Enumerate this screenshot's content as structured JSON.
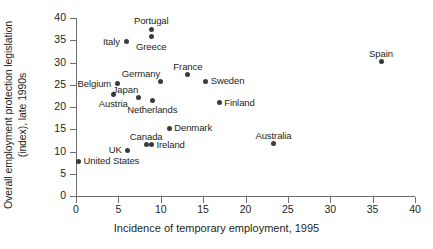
{
  "chart_data": {
    "type": "scatter",
    "title": "",
    "xlabel": "Incidence of temporary employment, 1995",
    "ylabel_line1": "Overall employment protection legislation",
    "ylabel_line2": "(index), late 1990s",
    "xlim": [
      0,
      40
    ],
    "ylim": [
      0,
      40
    ],
    "xticks": [
      "0",
      "5",
      "10",
      "15",
      "20",
      "25",
      "30",
      "35",
      "40"
    ],
    "yticks": [
      "0",
      "5",
      "10",
      "15",
      "20",
      "25",
      "30",
      "35",
      "40"
    ],
    "grid": false,
    "legend": "none",
    "marker_color": "#3b3b3d",
    "axis_color": "#6d6e71",
    "points": [
      {
        "name": "Portugal",
        "x": 8.9,
        "y": 37.5,
        "label_pos": "above"
      },
      {
        "name": "Greece",
        "x": 8.9,
        "y": 35.8,
        "label_pos": "below"
      },
      {
        "name": "Italy",
        "x": 5.9,
        "y": 34.7,
        "label_pos": "left"
      },
      {
        "name": "France",
        "x": 13.2,
        "y": 27.3,
        "label_pos": "above"
      },
      {
        "name": "Sweden",
        "x": 15.3,
        "y": 25.8,
        "label_pos": "right"
      },
      {
        "name": "Germany",
        "x": 10.0,
        "y": 25.8,
        "label_pos": "upleft"
      },
      {
        "name": "Belgium",
        "x": 4.9,
        "y": 25.2,
        "label_pos": "left"
      },
      {
        "name": "Austria",
        "x": 4.4,
        "y": 22.9,
        "label_pos": "below"
      },
      {
        "name": "Japan",
        "x": 7.4,
        "y": 22.2,
        "label_pos": "upleft"
      },
      {
        "name": "Netherlands",
        "x": 9.0,
        "y": 21.5,
        "label_pos": "below"
      },
      {
        "name": "Finland",
        "x": 16.9,
        "y": 21.0,
        "label_pos": "right"
      },
      {
        "name": "Spain",
        "x": 36.0,
        "y": 30.2,
        "label_pos": "above"
      },
      {
        "name": "Denmark",
        "x": 11.0,
        "y": 15.2,
        "label_pos": "right"
      },
      {
        "name": "Canada",
        "x": 8.3,
        "y": 11.5,
        "label_pos": "above"
      },
      {
        "name": "Ireland",
        "x": 8.9,
        "y": 11.5,
        "label_pos": "right"
      },
      {
        "name": "UK",
        "x": 6.1,
        "y": 10.3,
        "label_pos": "left"
      },
      {
        "name": "United States",
        "x": 0.3,
        "y": 7.8,
        "label_pos": "right"
      },
      {
        "name": "Australia",
        "x": 23.3,
        "y": 11.7,
        "label_pos": "above"
      }
    ]
  }
}
